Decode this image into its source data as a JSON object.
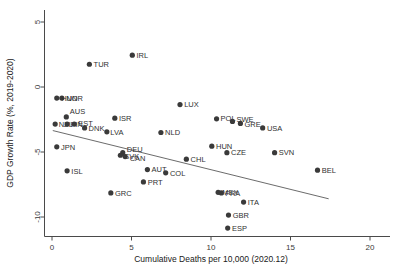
{
  "chart_data": {
    "type": "scatter",
    "title": "",
    "xlabel": "Cumulative Deaths per 10,000 (2020.12)",
    "ylabel": "GDP Growth Rate (%, 2019-2020)",
    "xlim": [
      -0.6,
      20.8
    ],
    "ylim": [
      -11.6,
      5.8
    ],
    "xticks": [
      0,
      5,
      10,
      15,
      20
    ],
    "xticklabels": [
      "0",
      "5",
      "10",
      "15",
      "20"
    ],
    "yticks": [
      5,
      0,
      -5,
      -10
    ],
    "yticklabels": [
      "5",
      "0",
      "-5",
      "-10"
    ],
    "grid": false,
    "legend": false,
    "marker_color": "#3a3a3a",
    "fit_line_color": "#5a5a5a",
    "fit_line": {
      "x0": 0.05,
      "y0": -3.35,
      "x1": 17.4,
      "y1": -8.6
    },
    "points": [
      {
        "label": "IRL",
        "x": 5.05,
        "y": 2.45
      },
      {
        "label": "TUR",
        "x": 2.35,
        "y": 1.75
      },
      {
        "label": "NOR",
        "x": 0.62,
        "y": -0.85
      },
      {
        "label": "HUN",
        "x": 0.3,
        "y": -0.85
      },
      {
        "label": "LUX",
        "x": 8.05,
        "y": -1.35
      },
      {
        "label": "AUS",
        "x": 0.9,
        "y": -2.3
      },
      {
        "label": "ISR",
        "x": 3.95,
        "y": -2.4
      },
      {
        "label": "POL",
        "x": 10.35,
        "y": -2.45
      },
      {
        "label": "NZL",
        "x": 0.2,
        "y": -2.85
      },
      {
        "label": "FIN",
        "x": 0.95,
        "y": -2.85
      },
      {
        "label": "EST",
        "x": 1.4,
        "y": -2.85
      },
      {
        "label": "SWE",
        "x": 11.35,
        "y": -2.65
      },
      {
        "label": "GRE",
        "x": 11.85,
        "y": -2.8
      },
      {
        "label": "DNK",
        "x": 2.05,
        "y": -3.15
      },
      {
        "label": "USA",
        "x": 13.25,
        "y": -3.15
      },
      {
        "label": "LVA",
        "x": 3.45,
        "y": -3.45
      },
      {
        "label": "NLD",
        "x": 6.85,
        "y": -3.5
      },
      {
        "label": "JPN",
        "x": 0.3,
        "y": -4.6
      },
      {
        "label": "DEU",
        "x": 4.45,
        "y": -5.05
      },
      {
        "label": "SVK",
        "x": 4.3,
        "y": -5.25
      },
      {
        "label": "CAN",
        "x": 4.6,
        "y": -5.35
      },
      {
        "label": "HUN2",
        "x": 10.05,
        "y": -4.55
      },
      {
        "label": "CZE",
        "x": 11.0,
        "y": -5.05
      },
      {
        "label": "SVN",
        "x": 14.0,
        "y": -5.05
      },
      {
        "label": "CHL",
        "x": 8.45,
        "y": -5.55
      },
      {
        "label": "ISL",
        "x": 0.95,
        "y": -6.45
      },
      {
        "label": "AUT",
        "x": 6.0,
        "y": -6.35
      },
      {
        "label": "COL",
        "x": 7.15,
        "y": -6.6
      },
      {
        "label": "BEL",
        "x": 16.7,
        "y": -6.4
      },
      {
        "label": "PRT",
        "x": 5.75,
        "y": -7.3
      },
      {
        "label": "GRC",
        "x": 3.7,
        "y": -8.15
      },
      {
        "label": "MEX",
        "x": 10.45,
        "y": -8.1
      },
      {
        "label": "FRA",
        "x": 10.65,
        "y": -8.15
      },
      {
        "label": "ITA",
        "x": 12.05,
        "y": -8.85
      },
      {
        "label": "GBR",
        "x": 11.1,
        "y": -9.85
      },
      {
        "label": "ESP",
        "x": 11.05,
        "y": -10.85
      }
    ]
  }
}
